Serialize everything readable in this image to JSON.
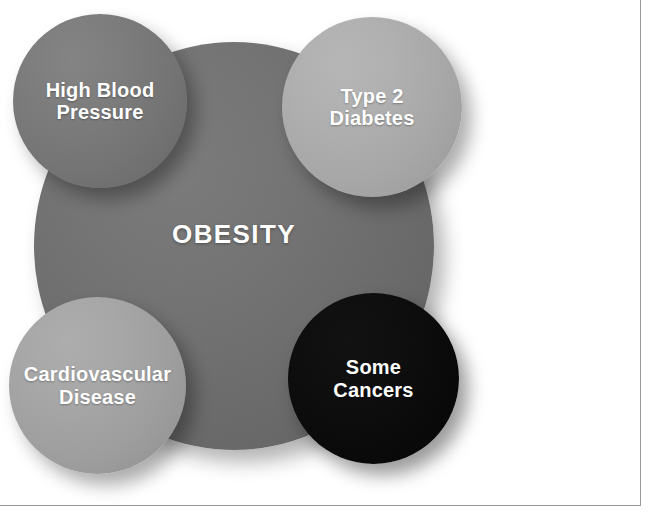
{
  "figure": {
    "center": {
      "id": "obesity",
      "label": "OBESITY",
      "color": "#6e6e6e",
      "text_color": "#ffffff"
    },
    "bubbles": [
      {
        "id": "high-blood-pressure",
        "label": "High Blood\nPressure",
        "position": "top-left",
        "color": "#757575",
        "text_color": "#ffffff"
      },
      {
        "id": "type-2-diabetes",
        "label": "Type 2\nDiabetes",
        "position": "top-right",
        "color": "#a8a8a8",
        "text_color": "#ffffff"
      },
      {
        "id": "cardiovascular-disease",
        "label": "Cardiovascular\nDisease",
        "position": "bottom-left",
        "color": "#9e9e9e",
        "text_color": "#ffffff"
      },
      {
        "id": "some-cancers",
        "label": "Some\nCancers",
        "position": "bottom-right",
        "color": "#0a0a0a",
        "text_color": "#ffffff"
      }
    ],
    "background_color": "#ffffff",
    "rule_color": "#9a9a9a"
  }
}
